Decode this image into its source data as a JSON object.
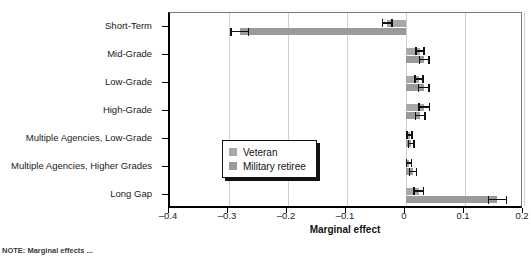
{
  "chart_data": {
    "type": "bar",
    "orientation": "horizontal",
    "title": "",
    "xlabel": "Marginal effect",
    "ylabel": "",
    "xlim": [
      -0.4,
      0.2
    ],
    "xticks": [
      "–0.4",
      "–0.3",
      "–0.2",
      "–0.1",
      "0",
      "0.1",
      "0.2"
    ],
    "xtick_values": [
      -0.4,
      -0.3,
      -0.2,
      -0.1,
      0,
      0.1,
      0.2
    ],
    "grid": true,
    "legend_position": "center",
    "categories": [
      "Short-Term",
      "Mid-Grade",
      "Low-Grade",
      "High-Grade",
      "Multiple Agencies, Low-Grade",
      "Multiple Agencies, Higher Grades",
      "Long Gap"
    ],
    "series": [
      {
        "name": "Veteran",
        "color": "#a8a8a8",
        "values": [
          -0.032,
          0.024,
          0.022,
          0.031,
          0.006,
          0.005,
          0.022
        ],
        "err_low": [
          -0.04,
          0.017,
          0.015,
          0.022,
          0.002,
          0.001,
          0.014
        ],
        "err_high": [
          -0.024,
          0.031,
          0.029,
          0.04,
          0.01,
          0.009,
          0.03
        ]
      },
      {
        "name": "Military retiree",
        "color": "#9a9a9a",
        "values": [
          -0.282,
          0.031,
          0.03,
          0.024,
          0.009,
          0.012,
          0.155
        ],
        "err_low": [
          -0.297,
          0.023,
          0.021,
          0.016,
          0.004,
          0.006,
          0.14
        ],
        "err_high": [
          -0.267,
          0.039,
          0.039,
          0.032,
          0.014,
          0.018,
          0.17
        ]
      }
    ]
  },
  "legend": {
    "items": [
      {
        "label": "Veteran",
        "color": "#a8a8a8"
      },
      {
        "label": "Military retiree",
        "color": "#9a9a9a"
      }
    ]
  },
  "footnote": {
    "text": "NOTE: Marginal effects ..."
  }
}
